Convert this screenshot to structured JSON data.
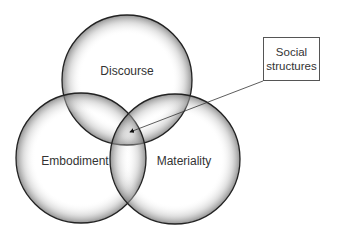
{
  "diagram": {
    "type": "venn",
    "circles": [
      {
        "id": "discourse",
        "label": "Discourse",
        "cx": 127,
        "cy": 80,
        "r": 65
      },
      {
        "id": "embodiment",
        "label": "Embodiment",
        "cx": 81,
        "cy": 158,
        "r": 65
      },
      {
        "id": "materiality",
        "label": "Materiality",
        "cx": 175,
        "cy": 159,
        "r": 65
      }
    ],
    "callout": {
      "line1": "Social",
      "line2": "structures",
      "points_to": "intersection of all three circles"
    }
  }
}
